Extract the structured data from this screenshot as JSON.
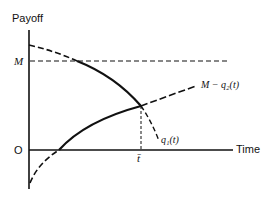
{
  "diagram": {
    "y_axis_label": "Payoff",
    "x_axis_label": "Time",
    "origin_label": "O",
    "m_label": "M",
    "t_bar_label": "t̄",
    "curve_q1_label": "q₁(t)",
    "curve_mq2_label": "M − q₂(t)",
    "colors": {
      "ink": "#111111",
      "background": "#ffffff"
    }
  }
}
